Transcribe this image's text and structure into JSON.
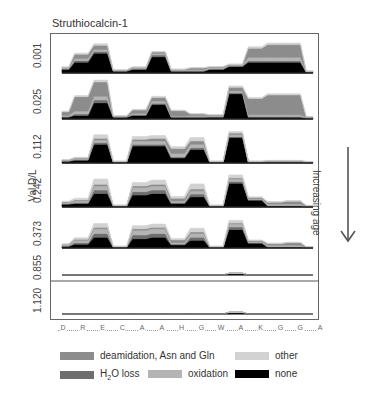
{
  "title": "Struthiocalcin-1",
  "y_axis_title": "Val D/L",
  "side_annotation": "Increasing age",
  "colors": {
    "deamidation": "#8c8c8c",
    "h2o_loss": "#6e6e6e",
    "oxidation": "#b4b4b4",
    "other": "#d2d2d2",
    "none": "#000000",
    "frame": "#666666"
  },
  "legend": {
    "deamidation": "deamidation, Asn and Gln",
    "h2o_loss_pre": "H",
    "h2o_loss_sub": "2",
    "h2o_loss_post": "O loss",
    "oxidation": "oxidation",
    "other": "other",
    "none": "none"
  },
  "chart_data": {
    "type": "area",
    "title": "Struthiocalcin-1",
    "xlabel": "",
    "ylabel": "Val D/L",
    "x_categories": [
      "D",
      "R",
      "E",
      "C",
      "A",
      "A",
      "H",
      "G",
      "W",
      "A",
      "K",
      "G",
      "G",
      "A"
    ],
    "panels": [
      "0.001",
      "0.025",
      "0.112",
      "0.242",
      "0.373",
      "0.855",
      "1.120"
    ],
    "series_order": [
      "none",
      "h2o_loss",
      "oxidation",
      "deamidation",
      "other"
    ],
    "note": "Stacked area profiles per Val D/L panel; values are relative heights (0-1) sampled at 14 residue positions, estimated visually.",
    "data": {
      "0.001": {
        "none": [
          0.1,
          0.3,
          0.55,
          0.05,
          0.1,
          0.45,
          0.05,
          0.05,
          0.1,
          0.18,
          0.3,
          0.3,
          0.3,
          0.02
        ],
        "h2o_loss": [
          0.02,
          0.05,
          0.05,
          0.01,
          0.02,
          0.05,
          0.01,
          0.01,
          0.02,
          0.02,
          0.04,
          0.04,
          0.04,
          0.01
        ],
        "oxidation": [
          0.02,
          0.05,
          0.05,
          0.01,
          0.02,
          0.04,
          0.02,
          0.03,
          0.03,
          0.02,
          0.1,
          0.1,
          0.1,
          0.01
        ],
        "deamidation": [
          0.02,
          0.12,
          0.12,
          0.01,
          0.02,
          0.04,
          0.02,
          0.05,
          0.02,
          0.02,
          0.25,
          0.35,
          0.35,
          0.01
        ],
        "other": [
          0.01,
          0.03,
          0.04,
          0.01,
          0.01,
          0.02,
          0.01,
          0.01,
          0.01,
          0.01,
          0.04,
          0.04,
          0.04,
          0.01
        ]
      },
      "0.025": {
        "none": [
          0.05,
          0.1,
          0.45,
          0.05,
          0.1,
          0.4,
          0.05,
          0.05,
          0.05,
          0.7,
          0.05,
          0.05,
          0.05,
          0.02
        ],
        "h2o_loss": [
          0.02,
          0.04,
          0.08,
          0.01,
          0.02,
          0.04,
          0.01,
          0.01,
          0.02,
          0.03,
          0.02,
          0.02,
          0.02,
          0.01
        ],
        "oxidation": [
          0.03,
          0.08,
          0.1,
          0.01,
          0.03,
          0.06,
          0.02,
          0.03,
          0.02,
          0.05,
          0.05,
          0.05,
          0.05,
          0.01
        ],
        "deamidation": [
          0.1,
          0.4,
          0.4,
          0.01,
          0.1,
          0.1,
          0.15,
          0.05,
          0.02,
          0.1,
          0.45,
          0.55,
          0.55,
          0.02
        ],
        "other": [
          0.02,
          0.03,
          0.05,
          0.01,
          0.02,
          0.03,
          0.02,
          0.01,
          0.01,
          0.04,
          0.03,
          0.03,
          0.03,
          0.01
        ]
      },
      "0.112": {
        "none": [
          0.05,
          0.08,
          0.55,
          0.02,
          0.5,
          0.5,
          0.15,
          0.4,
          0.02,
          0.75,
          0.02,
          0.02,
          0.02,
          0.01
        ],
        "h2o_loss": [
          0.01,
          0.02,
          0.05,
          0.01,
          0.05,
          0.05,
          0.03,
          0.05,
          0.01,
          0.03,
          0.01,
          0.01,
          0.01,
          0.01
        ],
        "oxidation": [
          0.02,
          0.03,
          0.08,
          0.01,
          0.1,
          0.1,
          0.1,
          0.1,
          0.01,
          0.05,
          0.01,
          0.02,
          0.02,
          0.01
        ],
        "deamidation": [
          0.01,
          0.02,
          0.05,
          0.01,
          0.05,
          0.08,
          0.15,
          0.1,
          0.01,
          0.05,
          0.01,
          0.02,
          0.02,
          0.01
        ],
        "other": [
          0.01,
          0.02,
          0.1,
          0.01,
          0.08,
          0.08,
          0.05,
          0.1,
          0.01,
          0.05,
          0.01,
          0.01,
          0.01,
          0.01
        ]
      },
      "0.242": {
        "none": [
          0.08,
          0.1,
          0.4,
          0.02,
          0.35,
          0.4,
          0.1,
          0.3,
          0.02,
          0.7,
          0.2,
          0.03,
          0.03,
          0.01
        ],
        "h2o_loss": [
          0.02,
          0.03,
          0.1,
          0.01,
          0.1,
          0.1,
          0.03,
          0.08,
          0.01,
          0.05,
          0.02,
          0.01,
          0.01,
          0.01
        ],
        "oxidation": [
          0.03,
          0.05,
          0.12,
          0.01,
          0.12,
          0.12,
          0.05,
          0.1,
          0.01,
          0.08,
          0.03,
          0.05,
          0.05,
          0.01
        ],
        "deamidation": [
          0.02,
          0.03,
          0.05,
          0.01,
          0.05,
          0.05,
          0.08,
          0.05,
          0.01,
          0.03,
          0.03,
          0.05,
          0.08,
          0.01
        ],
        "other": [
          0.02,
          0.05,
          0.15,
          0.01,
          0.1,
          0.12,
          0.05,
          0.15,
          0.01,
          0.08,
          0.02,
          0.02,
          0.02,
          0.01
        ]
      },
      "0.373": {
        "none": [
          0.05,
          0.12,
          0.35,
          0.02,
          0.3,
          0.35,
          0.1,
          0.25,
          0.02,
          0.6,
          0.15,
          0.03,
          0.03,
          0.01
        ],
        "h2o_loss": [
          0.02,
          0.05,
          0.12,
          0.01,
          0.12,
          0.12,
          0.03,
          0.1,
          0.01,
          0.08,
          0.03,
          0.01,
          0.01,
          0.01
        ],
        "oxidation": [
          0.03,
          0.08,
          0.15,
          0.01,
          0.15,
          0.15,
          0.05,
          0.12,
          0.01,
          0.1,
          0.03,
          0.05,
          0.05,
          0.01
        ],
        "deamidation": [
          0.02,
          0.03,
          0.05,
          0.01,
          0.05,
          0.05,
          0.08,
          0.05,
          0.01,
          0.03,
          0.03,
          0.05,
          0.08,
          0.01
        ],
        "other": [
          0.02,
          0.05,
          0.12,
          0.01,
          0.1,
          0.1,
          0.05,
          0.12,
          0.01,
          0.08,
          0.02,
          0.02,
          0.02,
          0.01
        ]
      },
      "0.855": {
        "none": [
          0,
          0,
          0,
          0,
          0,
          0,
          0,
          0,
          0,
          0.1,
          0,
          0,
          0,
          0
        ],
        "h2o_loss": [
          0,
          0,
          0,
          0,
          0,
          0,
          0,
          0,
          0,
          0,
          0,
          0,
          0,
          0
        ],
        "oxidation": [
          0,
          0,
          0,
          0,
          0,
          0,
          0,
          0,
          0,
          0,
          0,
          0,
          0,
          0
        ],
        "deamidation": [
          0,
          0,
          0,
          0,
          0,
          0,
          0,
          0,
          0,
          0,
          0,
          0,
          0,
          0
        ],
        "other": [
          0,
          0,
          0,
          0,
          0,
          0,
          0,
          0,
          0,
          0,
          0,
          0,
          0,
          0
        ]
      },
      "1.120": {
        "none": [
          0,
          0,
          0,
          0,
          0,
          0,
          0,
          0,
          0,
          0.06,
          0,
          0,
          0,
          0
        ],
        "h2o_loss": [
          0,
          0,
          0,
          0,
          0,
          0,
          0,
          0,
          0,
          0,
          0,
          0,
          0,
          0
        ],
        "oxidation": [
          0,
          0,
          0,
          0,
          0,
          0,
          0,
          0,
          0,
          0,
          0,
          0,
          0,
          0
        ],
        "deamidation": [
          0,
          0,
          0,
          0,
          0,
          0,
          0,
          0,
          0,
          0,
          0,
          0,
          0,
          0
        ],
        "other": [
          0,
          0,
          0,
          0,
          0,
          0,
          0,
          0,
          0,
          0,
          0,
          0,
          0,
          0
        ]
      }
    },
    "legend": [
      "deamidation, Asn and Gln",
      "H2O loss",
      "oxidation",
      "other",
      "none"
    ],
    "legend_position": "bottom"
  }
}
